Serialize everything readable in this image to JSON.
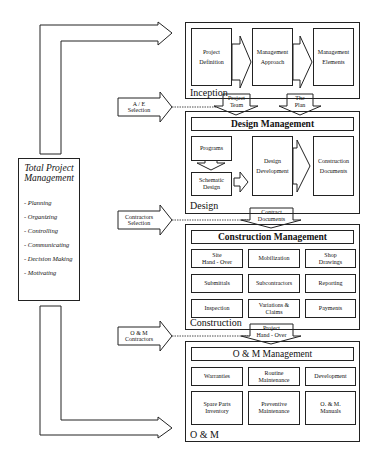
{
  "tpm": {
    "title_line1": "Total Project",
    "title_line2": "Management",
    "functions": [
      "- Planning",
      "- Organizing",
      "- Controlling",
      "- Communicating",
      "- Decision Making",
      "- Motivating"
    ]
  },
  "inputs": {
    "ae": {
      "line1": "A / E",
      "line2": "Selection"
    },
    "contractors": {
      "line1": "Contractors",
      "line2": "Selection"
    },
    "om": {
      "line1": "O & M",
      "line2": "Contractors"
    }
  },
  "inception": {
    "label": "Inception",
    "steps": [
      {
        "line1": "Project",
        "line2": "Definition"
      },
      {
        "line1": "Management",
        "line2": "Approach"
      },
      {
        "line1": "Management",
        "line2": "Elements"
      }
    ]
  },
  "connectors": {
    "project_team": {
      "line1": "Project",
      "line2": "Team"
    },
    "the_plan": {
      "line1": "The",
      "line2": "Plan"
    },
    "contract_documents": {
      "line1": "Contract",
      "line2": "Documents"
    },
    "project_handover": {
      "line1": "Project",
      "line2": "Hand - Over"
    }
  },
  "design": {
    "label": "Design",
    "title": "Design Management",
    "programs": "Programs",
    "schematic": {
      "line1": "Schematic",
      "line2": "Design"
    },
    "development": {
      "line1": "Design",
      "line2": "Development"
    },
    "construction_docs": {
      "line1": "Construction",
      "line2": "Documents"
    }
  },
  "construction": {
    "label": "Construction",
    "title": "Construction Management",
    "cells": [
      {
        "line1": "Site",
        "line2": "Hand - Over"
      },
      {
        "line1": "Mobilization",
        "line2": ""
      },
      {
        "line1": "Shop",
        "line2": "Drawings"
      },
      {
        "line1": "Submittals",
        "line2": ""
      },
      {
        "line1": "Subcontractors",
        "line2": ""
      },
      {
        "line1": "Reporting",
        "line2": ""
      },
      {
        "line1": "Inspection",
        "line2": ""
      },
      {
        "line1": "Variations &",
        "line2": "Claims"
      },
      {
        "line1": "Payments",
        "line2": ""
      }
    ]
  },
  "om": {
    "label": "O & M",
    "title": "O & M  Management",
    "cells": [
      {
        "line1": "Warranties",
        "line2": ""
      },
      {
        "line1": "Routine",
        "line2": "Maintenance"
      },
      {
        "line1": "Development",
        "line2": ""
      },
      {
        "line1": "Spare Parts",
        "line2": "Inventory"
      },
      {
        "line1": "Preventive",
        "line2": "Maintenance"
      },
      {
        "line1": "O. & M.",
        "line2": "Manuals"
      }
    ]
  }
}
